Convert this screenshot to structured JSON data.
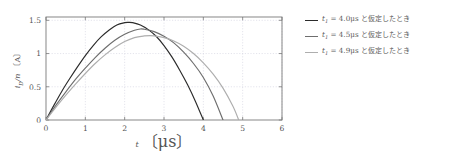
{
  "chart_data": {
    "type": "line",
    "title": "",
    "xlabel": "t 〔μs〕",
    "ylabel": "i_D/n 〔A〕",
    "xlim": [
      0,
      6
    ],
    "ylim": [
      0,
      1.55
    ],
    "xticks": [
      "0",
      "1",
      "2",
      "3",
      "4",
      "5",
      "6"
    ],
    "xtick_values": [
      0,
      1,
      2,
      3,
      4,
      5,
      6
    ],
    "yticks": [
      "0",
      "0.5",
      "1",
      "1.5"
    ],
    "ytick_values": [
      0,
      0.5,
      1,
      1.5
    ],
    "grid": true,
    "grid_color": "#c8c8d8",
    "legend_position": "right",
    "series": [
      {
        "name": "t1 = 4.0us to assumed",
        "label_math": "t",
        "label_sub": "1",
        "label_value": " = 4.0μs ",
        "label_jp": "と仮定したとき",
        "color": "#2b2b2b",
        "t_end": 4.0,
        "peak_t": 2.1,
        "peak_value": 1.47,
        "x": [
          0,
          0.2,
          0.4,
          0.6,
          0.8,
          1.0,
          1.2,
          1.4,
          1.6,
          1.8,
          2.0,
          2.1,
          2.2,
          2.4,
          2.6,
          2.8,
          3.0,
          3.2,
          3.4,
          3.6,
          3.8,
          4.0
        ],
        "y": [
          0,
          0.22,
          0.43,
          0.62,
          0.8,
          0.97,
          1.12,
          1.25,
          1.35,
          1.43,
          1.465,
          1.47,
          1.465,
          1.43,
          1.36,
          1.26,
          1.12,
          0.95,
          0.75,
          0.53,
          0.28,
          0.0
        ]
      },
      {
        "name": "t1 = 4.5us to assumed",
        "label_math": "t",
        "label_sub": "1",
        "label_value": " = 4.5μs ",
        "label_jp": "と仮定したとき",
        "color": "#6e6e6e",
        "t_end": 4.5,
        "peak_t": 2.4,
        "peak_value": 1.37,
        "x": [
          0,
          0.25,
          0.5,
          0.75,
          1.0,
          1.25,
          1.5,
          1.75,
          2.0,
          2.25,
          2.4,
          2.5,
          2.75,
          3.0,
          3.25,
          3.5,
          3.75,
          4.0,
          4.25,
          4.5
        ],
        "y": [
          0,
          0.22,
          0.42,
          0.61,
          0.78,
          0.94,
          1.08,
          1.2,
          1.29,
          1.35,
          1.37,
          1.365,
          1.33,
          1.26,
          1.16,
          1.02,
          0.85,
          0.64,
          0.36,
          0.0
        ]
      },
      {
        "name": "t1 = 4.9us to assumed",
        "label_math": "t",
        "label_sub": "1",
        "label_value": " = 4.9μs ",
        "label_jp": "と仮定したとき",
        "color": "#aeaeae",
        "t_end": 4.9,
        "peak_t": 2.65,
        "peak_value": 1.27,
        "x": [
          0,
          0.25,
          0.5,
          0.75,
          1.0,
          1.25,
          1.5,
          1.75,
          2.0,
          2.25,
          2.5,
          2.65,
          2.75,
          3.0,
          3.25,
          3.5,
          3.75,
          4.0,
          4.25,
          4.5,
          4.75,
          4.9
        ],
        "y": [
          0,
          0.19,
          0.37,
          0.54,
          0.7,
          0.85,
          0.98,
          1.09,
          1.18,
          1.24,
          1.265,
          1.27,
          1.265,
          1.24,
          1.19,
          1.11,
          1.0,
          0.86,
          0.69,
          0.48,
          0.21,
          0.0
        ]
      }
    ]
  },
  "axes": {
    "x_label_symbol": "t",
    "x_label_unit": "〔μs〕",
    "y_label_symbol": "i",
    "y_label_sub": "D",
    "y_label_rest": "/n",
    "y_label_unit": "〔A〕"
  }
}
